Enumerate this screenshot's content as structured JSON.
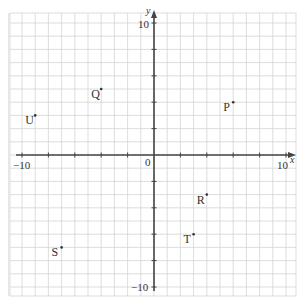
{
  "diagram": {
    "type": "coordinate-grid",
    "axes": {
      "x_label": "x",
      "y_label": "y",
      "origin_label": "0",
      "x_min_label": "−10",
      "x_max_label": "10",
      "y_min_label": "−10",
      "y_max_label": "10",
      "range": [
        -10,
        10
      ],
      "tick_step": 2
    },
    "points": [
      {
        "label": "P",
        "x": 6,
        "y": 4
      },
      {
        "label": "Q",
        "x": -4,
        "y": 5
      },
      {
        "label": "R",
        "x": 4,
        "y": -3
      },
      {
        "label": "S",
        "x": -7,
        "y": -7
      },
      {
        "label": "T",
        "x": 3,
        "y": -6
      },
      {
        "label": "U",
        "x": -9,
        "y": 3
      }
    ],
    "colors": {
      "grid": "#d4d4d4",
      "axis": "#444444",
      "text": "#333333"
    }
  },
  "chart_data": {
    "type": "scatter",
    "title": "",
    "xlabel": "x",
    "ylabel": "y",
    "xlim": [
      -10,
      10
    ],
    "ylim": [
      -10,
      10
    ],
    "grid": true,
    "series": [
      {
        "name": "points",
        "labels": [
          "P",
          "Q",
          "R",
          "S",
          "T",
          "U"
        ],
        "x": [
          6,
          -4,
          4,
          -7,
          3,
          -9
        ],
        "y": [
          4,
          5,
          -3,
          -7,
          -6,
          3
        ]
      }
    ]
  }
}
